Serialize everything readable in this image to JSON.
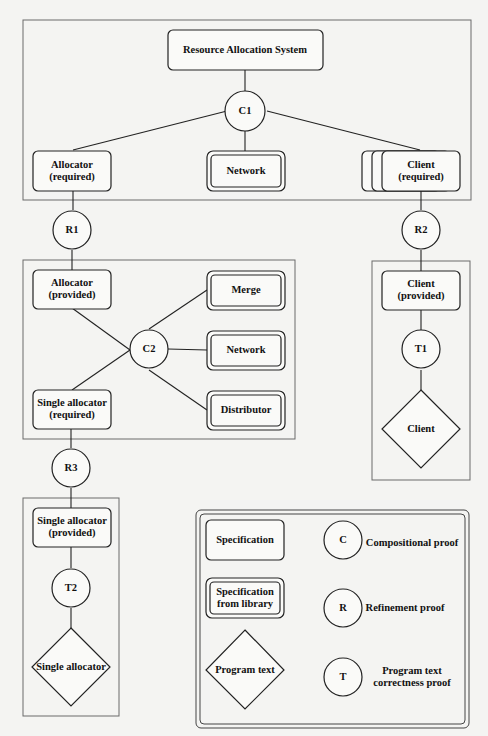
{
  "diagram": {
    "top": {
      "root": "Resource Allocation System",
      "c1": "C1",
      "allocator_required": [
        "Allocator",
        "(required)"
      ],
      "network": "Network",
      "client_required": [
        "Client",
        "(required)"
      ]
    },
    "proofs": {
      "r1": "R1",
      "r2": "R2",
      "r3": "R3",
      "c2": "C2",
      "t1": "T1",
      "t2": "T2"
    },
    "middle": {
      "allocator_provided": [
        "Allocator",
        "(provided)"
      ],
      "merge": "Merge",
      "network": "Network",
      "distributor": "Distributor",
      "single_allocator_required": [
        "Single allocator",
        "(required)"
      ]
    },
    "client_branch": {
      "client_provided": [
        "Client",
        "(provided)"
      ],
      "client_program": "Client"
    },
    "single_branch": {
      "single_allocator_provided": [
        "Single allocator",
        "(provided)"
      ],
      "single_allocator_program": "Single allocator"
    },
    "legend": {
      "specification": "Specification",
      "spec_library": [
        "Specification",
        "from library"
      ],
      "program_text": "Program text",
      "c": "C",
      "c_desc": "Compositional proof",
      "r": "R",
      "r_desc": "Refinement proof",
      "t": "T",
      "t_desc": [
        "Program text",
        "correctness proof"
      ]
    }
  }
}
